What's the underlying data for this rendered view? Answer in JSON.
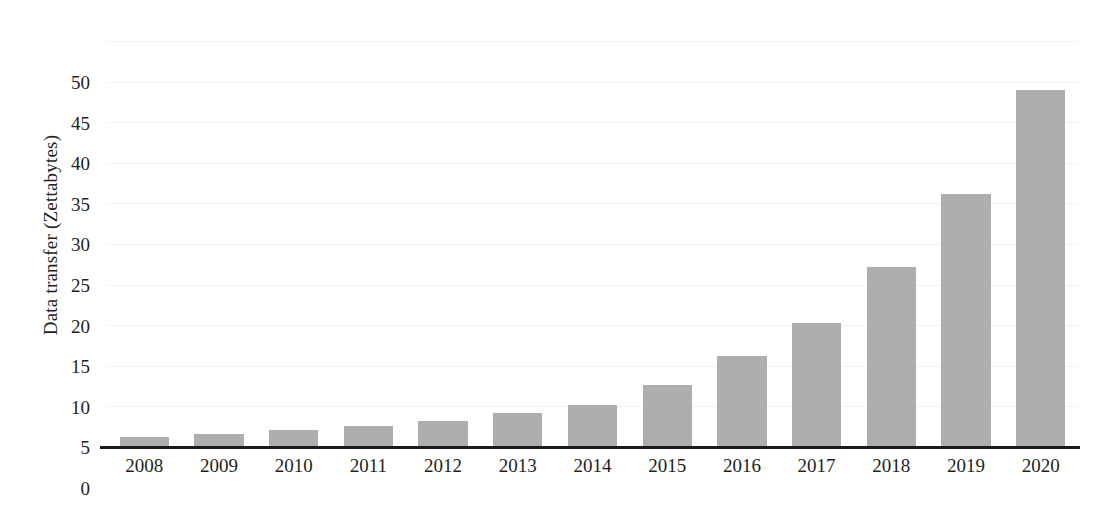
{
  "chart_data": {
    "type": "bar",
    "title": "",
    "xlabel": "",
    "ylabel": "Data transfer (Zettabytes)",
    "categories": [
      "2008",
      "2009",
      "2010",
      "2011",
      "2012",
      "2013",
      "2014",
      "2015",
      "2016",
      "2017",
      "2018",
      "2019",
      "2020"
    ],
    "values": [
      1.2,
      1.6,
      2.1,
      2.6,
      3.2,
      4.2,
      5.2,
      7.6,
      11.2,
      15.3,
      22.2,
      31.2,
      44.0
    ],
    "ylim": [
      0,
      50
    ],
    "ytick_values": [
      0,
      5,
      10,
      15,
      20,
      25,
      30,
      35,
      40,
      45,
      50
    ],
    "ytick_labels": [
      "0",
      "5",
      "10",
      "15",
      "20",
      "25",
      "30",
      "35",
      "40",
      "45",
      "50"
    ],
    "grid": true,
    "grid_axis": "y",
    "legend": false,
    "legend_position": "none",
    "series": [
      {
        "name": "Data transfer",
        "values": [
          1.2,
          1.6,
          2.1,
          2.6,
          3.2,
          4.2,
          5.2,
          7.6,
          11.2,
          15.3,
          22.2,
          31.2,
          44.0
        ]
      }
    ],
    "colors": {
      "bar_fill": "#aeaeae",
      "axis_line": "#1a1a1a",
      "gridline": "#f2f2f2",
      "text": "#231f20",
      "background": "#ffffff"
    }
  }
}
